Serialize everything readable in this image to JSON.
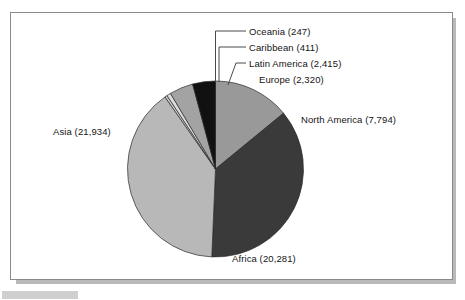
{
  "figure": {
    "frame_border_color": "#8a8a8a",
    "shadow_color": "#b9b9b9",
    "background_color": "#ffffff"
  },
  "chart_data": {
    "type": "pie",
    "title": "",
    "subtitle": "",
    "xlabel": "",
    "ylabel": "",
    "legend_position": "none",
    "grid": false,
    "label_format": "{name} ({value})",
    "total": 55402,
    "start_angle_deg": 0,
    "direction": "clockwise",
    "categories": [
      "North America",
      "Africa",
      "Asia",
      "Oceania",
      "Caribbean",
      "Latin America",
      "Europe"
    ],
    "values": [
      7794,
      20281,
      21934,
      247,
      411,
      2415,
      2320
    ],
    "slices": [
      {
        "name": "North America",
        "value": 7794,
        "value_text": "7,794",
        "label": "North America (7,794)",
        "percent": 14.07,
        "color": "#999999",
        "leader_line": false
      },
      {
        "name": "Africa",
        "value": 20281,
        "value_text": "20,281",
        "label": "Africa (20,281)",
        "percent": 36.61,
        "color": "#3a3a3a",
        "leader_line": false
      },
      {
        "name": "Asia",
        "value": 21934,
        "value_text": "21,934",
        "label": "Asia (21,934)",
        "percent": 39.59,
        "color": "#b8b8b8",
        "leader_line": false
      },
      {
        "name": "Oceania",
        "value": 247,
        "value_text": "247",
        "label": "Oceania (247)",
        "percent": 0.45,
        "color": "#c9c9c9",
        "leader_line": true
      },
      {
        "name": "Caribbean",
        "value": 411,
        "value_text": "411",
        "label": "Caribbean (411)",
        "percent": 0.74,
        "color": "#dcdcdc",
        "leader_line": true
      },
      {
        "name": "Latin America",
        "value": 2415,
        "value_text": "2,415",
        "label": "Latin America (2,415)",
        "percent": 4.36,
        "color": "#a3a3a3",
        "leader_line": true
      },
      {
        "name": "Europe",
        "value": 2320,
        "value_text": "2,320",
        "label": "Europe (2,320)",
        "percent": 4.19,
        "color": "#111111",
        "leader_line": false
      }
    ]
  }
}
